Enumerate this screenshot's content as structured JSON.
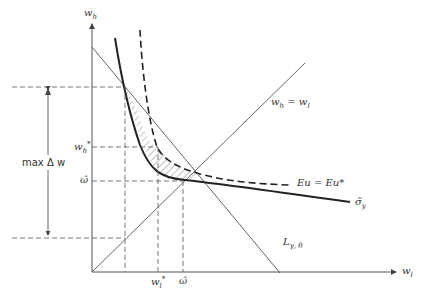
{
  "diagram": {
    "axes": {
      "y_label": "w",
      "y_label_sub": "h",
      "x_label": "w",
      "x_label_sub": "l"
    },
    "labels": {
      "max_delta_w": "max Δ w",
      "w_h_star": "w",
      "w_h_star_sub": "h",
      "w_h_star_sup": "*",
      "omega_hat_y": "ω̂",
      "omega_hat_x": "ω̂",
      "w_l_star": "w",
      "w_l_star_sub": "l",
      "w_l_star_sup": "*",
      "diag_line": "w",
      "diag_line_sub1": "h",
      "diag_line_eq": " = w",
      "diag_line_sub2": "l",
      "indiff_curve": "Eu = Eu*",
      "sigma_curve": "σ̃",
      "sigma_curve_sub": "y",
      "budget_line": "L",
      "budget_line_sub": "γ, θ"
    },
    "colors": {
      "line": "#333333",
      "thin_line": "#555555",
      "hatch": "#666666"
    }
  }
}
